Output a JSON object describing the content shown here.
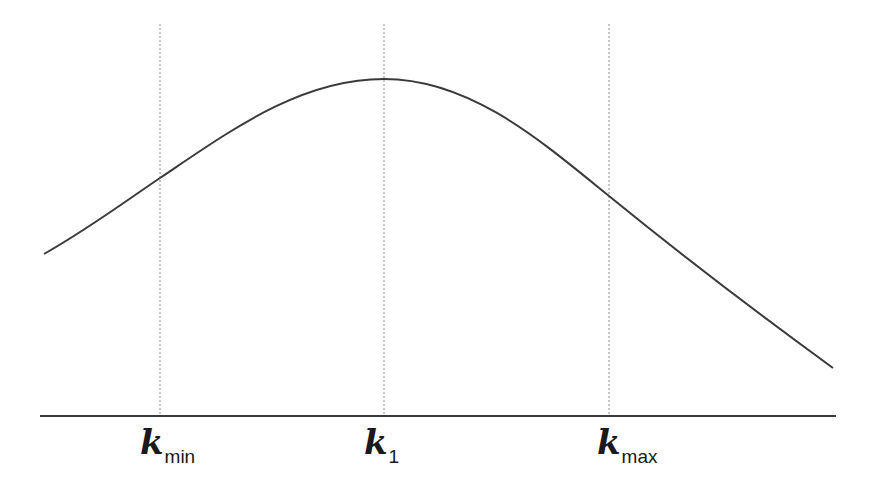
{
  "diagram": {
    "colors": {
      "curve": "#3a3a3a",
      "axis": "#3a3a3a",
      "guide": "#8a8a8a",
      "background": "#ffffff"
    },
    "axis": {
      "x1": 40,
      "x2": 836,
      "y": 416
    },
    "curve_path": "M44,254 C90,228 130,198 160,178 C230,131 300,79 384,79 C470,79 540,140 609,196 C690,262 760,315 833,368",
    "guides": [
      {
        "id": "kmin",
        "x": 160,
        "y1": 24,
        "y2": 416
      },
      {
        "id": "k1",
        "x": 384,
        "y1": 24,
        "y2": 416
      },
      {
        "id": "kmax",
        "x": 609,
        "y1": 24,
        "y2": 416
      }
    ],
    "labels": [
      {
        "id": "kmin",
        "main": "k",
        "sub": "min",
        "left": 140
      },
      {
        "id": "k1",
        "main": "k",
        "sub": "1",
        "left": 364
      },
      {
        "id": "kmax",
        "main": "k",
        "sub": "max",
        "left": 597
      }
    ]
  }
}
